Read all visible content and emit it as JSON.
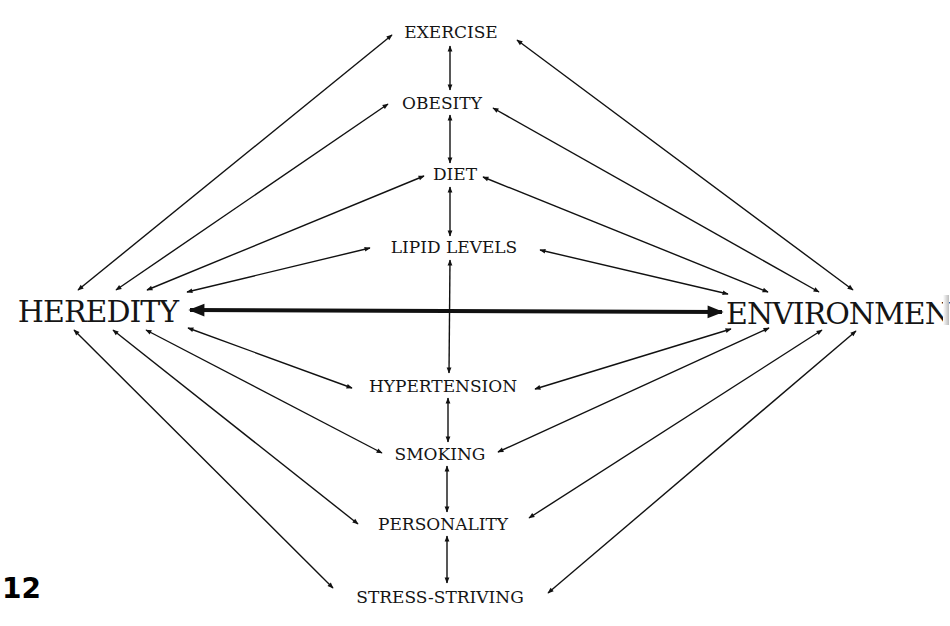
{
  "diagram": {
    "left_node": "HEREDITY",
    "right_node": "ENVIRONMENT",
    "right_node_visible": "ENVIRONMEN",
    "center_nodes": [
      "EXERCISE",
      "OBESITY",
      "DIET",
      "LIPID LEVELS",
      "HYPERTENSION",
      "SMOKING",
      "PERSONALITY",
      "STRESS-STRIVING"
    ],
    "page_number": "12",
    "relations": "bidirectional arrows: HEREDITY <-> ENVIRONMENT (bold); each center factor <-> HEREDITY, <-> ENVIRONMENT, and <-> adjacent factor vertically",
    "line_color": "#111111"
  }
}
